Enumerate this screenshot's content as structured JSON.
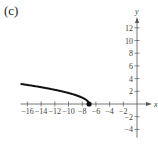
{
  "panel_label": "(c)",
  "chart_data": {
    "type": "line",
    "title": "",
    "xlabel": "x",
    "ylabel": "y",
    "xlim": [
      -17,
      2
    ],
    "ylim": [
      -5,
      14
    ],
    "grid": false,
    "x_ticks": [
      -16,
      -14,
      -12,
      -10,
      -8,
      -6,
      -4,
      -2
    ],
    "y_ticks": [
      12,
      10,
      8,
      6,
      4,
      2,
      -2,
      -4
    ],
    "series": [
      {
        "name": "y = sqrt(-(x+7))",
        "x": [
          -17,
          -16,
          -15,
          -14,
          -13,
          -12,
          -11,
          -10,
          -9,
          -8,
          -7.5,
          -7
        ],
        "y": [
          3.16,
          3.0,
          2.83,
          2.65,
          2.45,
          2.24,
          2.0,
          1.73,
          1.41,
          1.0,
          0.71,
          0
        ]
      }
    ],
    "annotations": [
      {
        "type": "endpoint-dot",
        "x": -7,
        "y": 0
      }
    ]
  }
}
